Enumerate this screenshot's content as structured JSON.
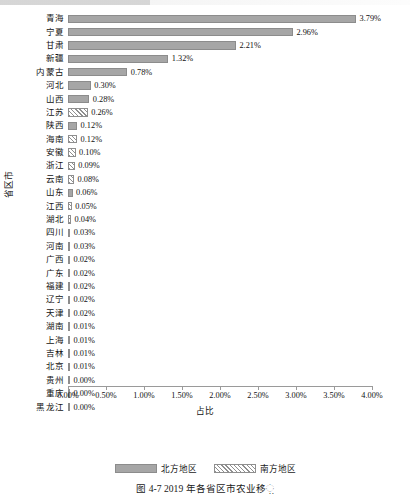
{
  "chart_data": {
    "type": "bar",
    "orientation": "horizontal",
    "title": "",
    "xlabel": "占比",
    "ylabel": "省区市",
    "xlim": [
      0,
      4
    ],
    "xtick_labels": [
      "0.00%",
      "0.50%",
      "1.00%",
      "1.50%",
      "2.00%",
      "2.50%",
      "3.00%",
      "3.50%",
      "4.00%"
    ],
    "xtick_values": [
      0,
      0.5,
      1.0,
      1.5,
      2.0,
      2.5,
      3.0,
      3.5,
      4.0
    ],
    "grid": false,
    "legend_position": "bottom",
    "legend": [
      {
        "name": "北方地区",
        "pattern": "solid",
        "color": "#a6a6a6"
      },
      {
        "name": "南方地区",
        "pattern": "diagonal-hatch",
        "color": "#8f8f8f"
      }
    ],
    "categories": [
      "青海",
      "宁夏",
      "甘肃",
      "新疆",
      "内蒙古",
      "河北",
      "山西",
      "江苏",
      "陕西",
      "海南",
      "安徽",
      "浙江",
      "云南",
      "山东",
      "江西",
      "湖北",
      "四川",
      "河南",
      "广西",
      "广东",
      "福建",
      "辽宁",
      "天津",
      "湖南",
      "上海",
      "吉林",
      "北京",
      "贵州",
      "重庆",
      "黑龙江"
    ],
    "values": [
      3.79,
      2.96,
      2.21,
      1.32,
      0.78,
      0.3,
      0.28,
      0.26,
      0.12,
      0.12,
      0.1,
      0.09,
      0.08,
      0.06,
      0.05,
      0.04,
      0.03,
      0.03,
      0.02,
      0.02,
      0.02,
      0.02,
      0.02,
      0.01,
      0.01,
      0.01,
      0.01,
      0.0,
      0.0,
      0.0
    ],
    "value_labels": [
      "3.79%",
      "2.96%",
      "2.21%",
      "1.32%",
      "0.78%",
      "0.30%",
      "0.28%",
      "0.26%",
      "0.12%",
      "0.12%",
      "0.10%",
      "0.09%",
      "0.08%",
      "0.06%",
      "0.05%",
      "0.04%",
      "0.03%",
      "0.03%",
      "0.02%",
      "0.02%",
      "0.02%",
      "0.02%",
      "0.02%",
      "0.01%",
      "0.01%",
      "0.01%",
      "0.01%",
      "0.00%",
      "0.00%",
      "0.00%"
    ],
    "groups": [
      "north",
      "north",
      "north",
      "north",
      "north",
      "north",
      "north",
      "south",
      "north",
      "south",
      "south",
      "south",
      "south",
      "north",
      "south",
      "south",
      "south",
      "north",
      "south",
      "south",
      "south",
      "north",
      "north",
      "south",
      "south",
      "north",
      "north",
      "south",
      "south",
      "north"
    ]
  },
  "caption": "图 4-7  2019 年各省区市农业移಼"
}
